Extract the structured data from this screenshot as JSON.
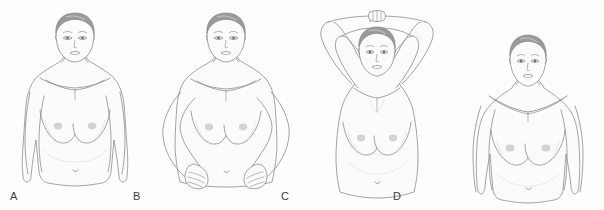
{
  "figure": {
    "panel_count": 4,
    "background_color": "#fdfdfd",
    "line_color": "#8c8c8c",
    "skin_fill": "#fbfbfb",
    "shadow_color": "#e8e8e8",
    "hair_color": "#9a9a9a",
    "hair_highlight": "#c4c4c4",
    "areola_color": "#c6c6c6",
    "label_color": "#3b3b3b"
  },
  "panels": [
    {
      "label": "A",
      "label_x": 10,
      "label_y": 191,
      "pose_name": "arms-at-sides",
      "pose_description": "Standing upright facing forward with both arms relaxed down at the sides",
      "figure_offset_x": 0,
      "figure_offset_y": 0
    },
    {
      "label": "B",
      "label_x": 133,
      "label_y": 191,
      "pose_name": "hands-on-hips",
      "pose_description": "Standing with both hands pressed firmly on the hips, elbows flared outward",
      "figure_offset_x": 151,
      "figure_offset_y": 0
    },
    {
      "label": "C",
      "label_x": 281,
      "label_y": 191,
      "pose_name": "arms-raised-overhead",
      "pose_description": "Standing with both arms raised and hands clasped above the head",
      "figure_offset_x": 302,
      "figure_offset_y": 0
    },
    {
      "label": "D",
      "label_x": 393,
      "label_y": 191,
      "pose_name": "leaning-forward",
      "pose_description": "Leaning forward from the waist with arms extended down and shoulders rolled forward",
      "figure_offset_x": 453,
      "figure_offset_y": 0
    }
  ]
}
